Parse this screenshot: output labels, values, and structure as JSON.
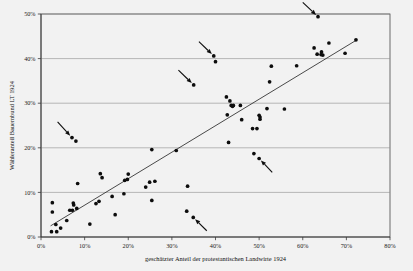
{
  "chart_data": {
    "type": "scatter",
    "title": "",
    "xlabel": "geschätzter Anteil der protestantischen Landwirte 1924",
    "ylabel": "Wähleranteil Bauernbund LT 1924",
    "xlim": [
      0,
      80
    ],
    "ylim": [
      0,
      50
    ],
    "grid": true,
    "legend": "none",
    "xticks": [
      "0%",
      "10%",
      "20%",
      "30%",
      "40%",
      "50%",
      "60%",
      "70%",
      "80%"
    ],
    "xtick_values": [
      0,
      10,
      20,
      30,
      40,
      50,
      60,
      70,
      80
    ],
    "yticks": [
      "0%",
      "10%",
      "20%",
      "30%",
      "40%",
      "50%"
    ],
    "ytick_values": [
      0,
      10,
      20,
      30,
      40,
      50
    ],
    "point_color": "#0d0d0d",
    "trendline_color": "#2b2b2b",
    "gridline_color": "#8d8d8d",
    "background_color": "#f2f2f2",
    "points": [
      [
        2.4,
        1.2
      ],
      [
        3.6,
        1.2
      ],
      [
        2.6,
        7.7
      ],
      [
        2.6,
        5.6
      ],
      [
        3.4,
        2.8
      ],
      [
        4.5,
        2.0
      ],
      [
        5.9,
        3.7
      ],
      [
        6.6,
        6.0
      ],
      [
        7.2,
        6.0
      ],
      [
        7.4,
        7.6
      ],
      [
        7.5,
        7.2
      ],
      [
        7.1,
        22.3
      ],
      [
        8.0,
        21.5
      ],
      [
        8.2,
        6.4
      ],
      [
        8.4,
        12.0
      ],
      [
        11.2,
        2.9
      ],
      [
        12.6,
        7.5
      ],
      [
        13.3,
        8.0
      ],
      [
        13.6,
        14.2
      ],
      [
        14.0,
        13.3
      ],
      [
        16.3,
        9.1
      ],
      [
        17.0,
        5.0
      ],
      [
        19.0,
        9.7
      ],
      [
        19.2,
        12.7
      ],
      [
        19.8,
        12.9
      ],
      [
        20.0,
        14.1
      ],
      [
        24.0,
        11.2
      ],
      [
        24.9,
        12.3
      ],
      [
        25.4,
        8.2
      ],
      [
        25.4,
        19.6
      ],
      [
        26.1,
        12.5
      ],
      [
        31.0,
        19.4
      ],
      [
        33.4,
        5.8
      ],
      [
        33.6,
        11.4
      ],
      [
        34.9,
        4.4
      ],
      [
        35.0,
        34.1
      ],
      [
        39.6,
        40.6
      ],
      [
        40.0,
        39.3
      ],
      [
        42.5,
        31.4
      ],
      [
        42.7,
        27.4
      ],
      [
        43.0,
        21.2
      ],
      [
        43.3,
        30.5
      ],
      [
        43.6,
        29.5
      ],
      [
        43.9,
        29.3
      ],
      [
        44.1,
        29.5
      ],
      [
        45.7,
        29.5
      ],
      [
        46.0,
        26.3
      ],
      [
        48.5,
        24.3
      ],
      [
        48.8,
        18.7
      ],
      [
        49.5,
        24.3
      ],
      [
        50.0,
        27.3
      ],
      [
        50.2,
        26.9
      ],
      [
        50.2,
        26.4
      ],
      [
        50.0,
        17.6
      ],
      [
        51.8,
        28.8
      ],
      [
        52.4,
        34.8
      ],
      [
        52.8,
        38.3
      ],
      [
        55.8,
        28.7
      ],
      [
        58.6,
        38.4
      ],
      [
        62.6,
        42.4
      ],
      [
        63.3,
        41.0
      ],
      [
        63.5,
        49.4
      ],
      [
        64.2,
        40.9
      ],
      [
        64.3,
        41.5
      ],
      [
        64.6,
        40.8
      ],
      [
        66.0,
        43.5
      ],
      [
        69.7,
        41.2
      ],
      [
        72.2,
        44.2
      ]
    ],
    "trendline": {
      "x_start": 2.2,
      "y_start": 2.5,
      "x_end": 72.4,
      "y_end": 44.2
    },
    "annotations": [
      {
        "label": "arrow-to-point-1",
        "target_x": 7.1,
        "target_y": 22.3,
        "tail_x": 3.8,
        "tail_y": 25.8
      },
      {
        "label": "arrow-to-point-2",
        "target_x": 35.0,
        "target_y": 34.1,
        "tail_x": 31.5,
        "tail_y": 37.4
      },
      {
        "label": "arrow-to-point-3",
        "target_x": 39.6,
        "target_y": 40.6,
        "tail_x": 36.2,
        "tail_y": 43.8
      },
      {
        "label": "arrow-to-point-4",
        "target_x": 63.5,
        "target_y": 49.4,
        "tail_x": 60.0,
        "tail_y": 52.6
      },
      {
        "label": "arrow-to-point-5",
        "target_x": 50.0,
        "target_y": 17.6,
        "tail_x": 53.0,
        "tail_y": 14.5
      },
      {
        "label": "arrow-to-point-6",
        "target_x": 34.9,
        "target_y": 4.4,
        "tail_x": 38.0,
        "tail_y": 1.4
      }
    ]
  }
}
